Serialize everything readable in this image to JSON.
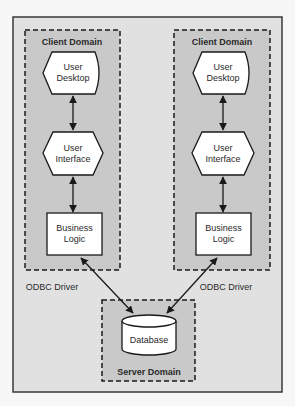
{
  "diagram": {
    "colors": {
      "page_bg": "#f7f7f7",
      "frame_fill": "#e1e1e1",
      "frame_stroke": "#3a3a3a",
      "domain_fill": "#c9c9c9",
      "node_fill": "#ffffff",
      "line": "#1a1a1a",
      "text": "#2a2a2a"
    },
    "client_domains": [
      {
        "title": "Client Domain",
        "user_desktop": [
          "User",
          "Desktop"
        ],
        "user_interface": [
          "User",
          "Interface"
        ],
        "business_logic": [
          "Business",
          "Logic"
        ]
      },
      {
        "title": "Client Domain",
        "user_desktop": [
          "User",
          "Desktop"
        ],
        "user_interface": [
          "User",
          "Interface"
        ],
        "business_logic": [
          "Business",
          "Logic"
        ]
      }
    ],
    "server_domain": {
      "title": "Server Domain",
      "database": "Database"
    },
    "connections": {
      "left_label": "ODBC Driver",
      "right_label": "ODBC Driver"
    }
  }
}
